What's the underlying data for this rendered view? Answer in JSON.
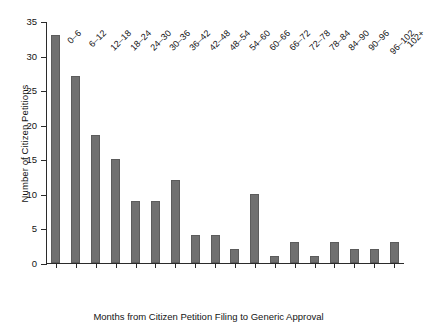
{
  "chart_data": {
    "type": "bar",
    "title": "",
    "xlabel": "Months from Citizen Petition Filing to Generic Approval",
    "ylabel": "Number of Citizen Petitions",
    "categories": [
      "0–6",
      "6–12",
      "12–18",
      "18–24",
      "24–30",
      "30–36",
      "36–42",
      "42–48",
      "48–54",
      "54–60",
      "60–66",
      "66–72",
      "72–78",
      "78–84",
      "84–90",
      "90–96",
      "96–102",
      "102+"
    ],
    "values": [
      33,
      27,
      18.5,
      15,
      9,
      9,
      12,
      4,
      4,
      2,
      10,
      1,
      3,
      1,
      3,
      2,
      2,
      3
    ],
    "ylim": [
      0,
      35
    ],
    "yticks": [
      0,
      5,
      10,
      15,
      20,
      25,
      30,
      35
    ],
    "ytick_labels": [
      "0",
      "5",
      "10",
      "15",
      "20",
      "25",
      "30",
      "35"
    ],
    "grid": false,
    "legend": null,
    "bar_color": "#707070",
    "axis_color": "#2b2b2b"
  }
}
